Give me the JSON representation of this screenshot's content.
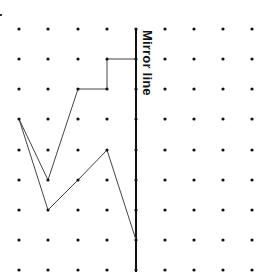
{
  "diagram": {
    "mirror_label": "Mirror line",
    "grid": {
      "columns_x": [
        19,
        48,
        78,
        107,
        136,
        165,
        194,
        223,
        252
      ],
      "rows_y": [
        29,
        59,
        89,
        119,
        150,
        180,
        210,
        240,
        270
      ],
      "dot_radius": 1.6,
      "dot_color": "#111111"
    },
    "mirror": {
      "column_index": 4,
      "x": 136,
      "y_start": 29,
      "y_end": 272,
      "color": "#111111",
      "width": 2
    },
    "shape": {
      "color": "#444444",
      "width": 1,
      "vertices_grid": [
        [
          4,
          1
        ],
        [
          3,
          1
        ],
        [
          3,
          2
        ],
        [
          2,
          2
        ],
        [
          1,
          5
        ],
        [
          0,
          3
        ],
        [
          1,
          6
        ],
        [
          2,
          5
        ],
        [
          3,
          4
        ],
        [
          4,
          7
        ]
      ]
    }
  }
}
